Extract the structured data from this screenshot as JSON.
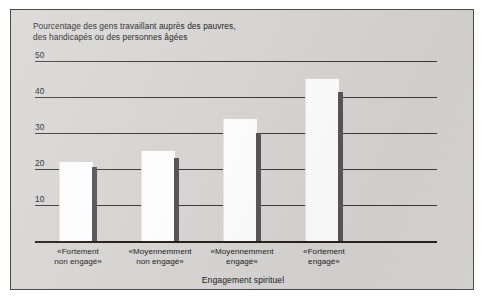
{
  "chart_data": {
    "type": "bar",
    "title": "Pourcentage des gens travaillant auprès des pauvres,\ndes handicapés ou des personnes âgées",
    "xlabel": "Engagement spirituel",
    "ylabel": "",
    "ylim": [
      0,
      50
    ],
    "yticks": [
      50,
      40,
      30,
      20,
      10
    ],
    "ytick_labels": [
      "50",
      "40",
      "30",
      "20",
      "10"
    ],
    "grid": true,
    "legend": "none",
    "categories": [
      "«Fortement\nnon engagé»",
      "«Moyennemment\nnon engagé»",
      "«Moyennemment\nengagé»",
      "«Fortement\nengagé»"
    ],
    "series": [
      {
        "name": "barre claire",
        "color": "#fdfdfd",
        "values": [
          22,
          25,
          34,
          45
        ]
      },
      {
        "name": "barre foncée",
        "color": "#56565a",
        "values": [
          20.5,
          23,
          30,
          41.5
        ]
      }
    ]
  },
  "figure": {
    "panel_color": "#d6d5d3",
    "border_color": "#4a4a48",
    "axis_color": "#232321",
    "gridline_color": "#3b3b39",
    "text_color": "#1c1c1c"
  }
}
